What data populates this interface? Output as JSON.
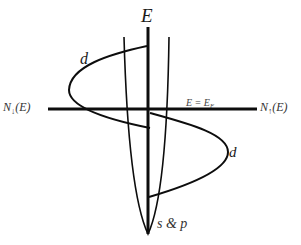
{
  "diagram": {
    "axes": {
      "vertical_label": "E",
      "left_label_prefix": "N",
      "left_label_spin": "↓",
      "left_label_suffix": "(E)",
      "right_label_prefix": "N",
      "right_label_spin": "↑",
      "right_label_suffix": "(E)"
    },
    "fermi_level": {
      "label_lhs": "E = E",
      "label_sub": "F"
    },
    "bands": {
      "d_upper_label": "d",
      "d_lower_label": "d",
      "sp_label": "s & p"
    },
    "colors": {
      "line": "#0d0d0d",
      "background": "#ffffff"
    }
  }
}
